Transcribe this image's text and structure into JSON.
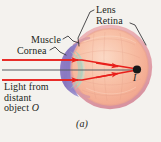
{
  "figure": {
    "panel_label": "(a)",
    "background_color": "#f4f2ee",
    "caption_subject": "human eye focusing light from a distant object"
  },
  "labels": {
    "lens": "Lens",
    "retina": "Retina",
    "muscle": "Muscle",
    "cornea": "Cornea",
    "light_line1": "Light from",
    "light_line2": "distant",
    "light_line3": "object O",
    "image_point": "I"
  },
  "colors": {
    "ray": "#e8201c",
    "axis": "#595b60",
    "sclera_fill": "#f6b79a",
    "sclera_ring": "#e8a9ae",
    "cornea": "#7a6ab5",
    "lens": "#8fc4b4",
    "focal_point": "#171717",
    "leader_line": "#3a3a3c",
    "text": "#231f20"
  },
  "geometry": {
    "eye_center_x": 110,
    "eye_center_y": 67,
    "eye_radius": 42,
    "focal_point_x": 137,
    "focal_point_y": 69,
    "ray_top_y": 60,
    "axis_y": 70,
    "ray_bottom_y": 80,
    "ray_start_x": 2
  }
}
